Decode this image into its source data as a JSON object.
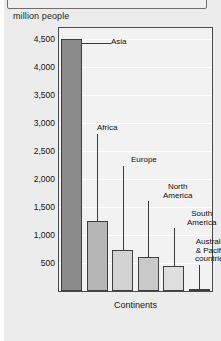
{
  "top_caption_box": {
    "text": ""
  },
  "chart_data": {
    "type": "bar",
    "title": "",
    "subtitle": "",
    "unit_label": "million people",
    "xlabel": "Continents",
    "ylabel": "million people",
    "categories": [
      "Asia",
      "Africa",
      "Europe",
      "North America",
      "South America",
      "Australia & Pacific countries"
    ],
    "values": [
      4500,
      1250,
      730,
      600,
      450,
      40
    ],
    "ylim": [
      0,
      4700
    ],
    "yticks": [
      500,
      1000,
      1500,
      2000,
      2500,
      3000,
      3500,
      4000,
      4500
    ],
    "ytick_labels": [
      "500",
      "1,000",
      "1,500",
      "2,000",
      "2,500",
      "3,000",
      "3,500",
      "4,000",
      "4,500"
    ],
    "grid": true,
    "legend": "none",
    "bar_colors": [
      "#8a8a8a",
      "#b6b6b6",
      "#d2d2d2",
      "#c9c9c9",
      "#dedede",
      "#f4f4f4"
    ],
    "annotations": [
      {
        "label": "Asia",
        "series_index": 0
      },
      {
        "label": "Africa",
        "series_index": 1
      },
      {
        "label": "Europe",
        "series_index": 2
      },
      {
        "label": "North\nAmerica",
        "series_index": 3
      },
      {
        "label": "South\nAmerica",
        "series_index": 4
      },
      {
        "label": "Australia\n& Pacific\ncountries",
        "series_index": 5
      }
    ]
  }
}
